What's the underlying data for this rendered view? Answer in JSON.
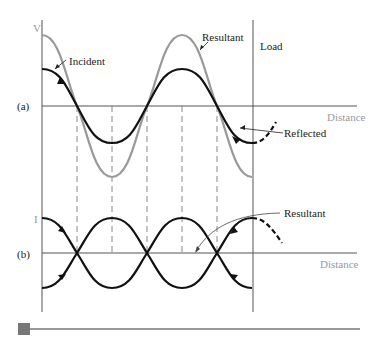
{
  "diagram": {
    "panel_a": {
      "label": "(a)",
      "y_axis_label": "V",
      "x_axis_label": "Distance",
      "curves": {
        "incident": "Incident",
        "resultant": "Resultant",
        "reflected": "Reflected"
      },
      "load_label": "Load"
    },
    "panel_b": {
      "label": "(b)",
      "y_axis_label": "I",
      "x_axis_label": "Distance",
      "curves": {
        "resultant": "Resultant"
      }
    },
    "colors": {
      "incident": "#111111",
      "resultant_gray": "#999999",
      "axis": "#555555",
      "dashed": "#888888",
      "scrollbar_thumb": "#777777",
      "scrollbar_track": "#999999"
    },
    "scrollbar": {
      "position": 0
    }
  }
}
